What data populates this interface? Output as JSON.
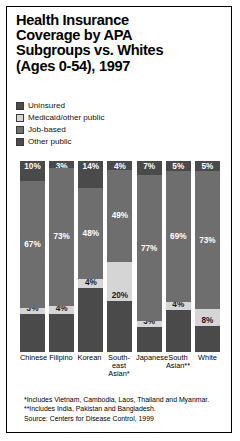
{
  "title": {
    "line1": "Health Insurance",
    "line2": "Coverage by APA",
    "line3": "Subgroups vs. Whites",
    "line4": "(Ages 0-54), 1997"
  },
  "legend": [
    {
      "label": "Uninsured",
      "color": "#4a4a4a"
    },
    {
      "label": "Medicaid/other public",
      "color": "#d5d5d5"
    },
    {
      "label": "Job-based",
      "color": "#6e6e6e"
    },
    {
      "label": "Other public",
      "color": "#4a4a4a"
    }
  ],
  "notes": {
    "note1": "*Includes Vietnam, Cambodia, Laos, Thailand and Myanmar.",
    "note2": "**Includes India, Pakistan and Bangladesh.",
    "source": "Source: Centers for Disease Control, 1999"
  },
  "chart_data": {
    "type": "bar",
    "subtype": "stacked-bar-100",
    "title": "Health Insurance Coverage by APA Subgroups vs. Whites (Ages 0-54), 1997",
    "xlabel": "",
    "ylabel": "",
    "ylim": [
      0,
      100
    ],
    "grid": false,
    "legend_position": "above-plot",
    "stack_order_top_to_bottom": [
      "Uninsured",
      "Job-based",
      "Medicaid/other public",
      "Other public"
    ],
    "categories": [
      "Chinese",
      "Filipino",
      "Korean",
      "South-east Asian*",
      "Japanese",
      "South Asian**",
      "White"
    ],
    "category_lines": [
      [
        "Chinese"
      ],
      [
        "Filipino"
      ],
      [
        "Korean"
      ],
      [
        "South-",
        "east",
        "Asian*"
      ],
      [
        "Japanese"
      ],
      [
        "South",
        "Asian**"
      ],
      [
        "White"
      ]
    ],
    "series": [
      {
        "name": "Uninsured",
        "color": "#4a4a4a",
        "values": [
          10,
          3,
          14,
          4,
          7,
          5,
          5
        ]
      },
      {
        "name": "Job-based",
        "color": "#6e6e6e",
        "values": [
          67,
          73,
          48,
          49,
          77,
          69,
          73
        ]
      },
      {
        "name": "Medicaid/other public",
        "color": "#d5d5d5",
        "values": [
          3,
          4,
          4,
          20,
          3,
          4,
          8
        ]
      },
      {
        "name": "Other public",
        "color": "#4a4a4a",
        "values": [
          20,
          20,
          34,
          27,
          13,
          22,
          14
        ]
      }
    ],
    "labeled_series": [
      "Uninsured",
      "Job-based",
      "Medicaid/other public"
    ],
    "unlabeled_series": [
      "Other public"
    ]
  }
}
